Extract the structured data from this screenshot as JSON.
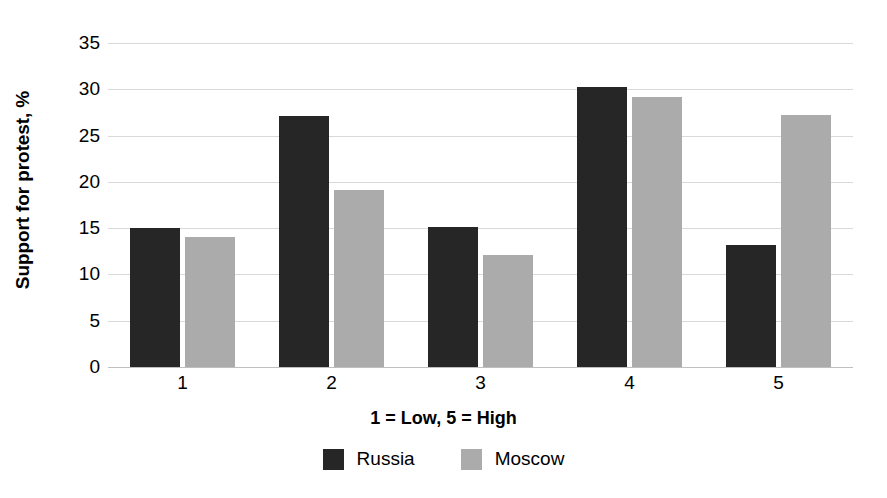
{
  "chart_data": {
    "type": "bar",
    "title": "",
    "subtitle": "",
    "xlabel": "1 = Low, 5 = High",
    "ylabel": "Support for protest, %",
    "categories": [
      "1",
      "2",
      "3",
      "4",
      "5"
    ],
    "series": [
      {
        "name": "Russia",
        "color": "#262626",
        "values": [
          15.0,
          27.1,
          15.1,
          30.2,
          13.2
        ]
      },
      {
        "name": "Moscow",
        "color": "#ababab",
        "values": [
          14.0,
          19.1,
          12.1,
          29.2,
          27.2
        ]
      }
    ],
    "ylim": [
      0,
      35
    ],
    "ytick_labels": [
      "0",
      "5",
      "10",
      "15",
      "20",
      "25",
      "30",
      "35"
    ],
    "ytick_values": [
      0,
      5,
      10,
      15,
      20,
      25,
      30,
      35
    ],
    "grid": true,
    "grid_color": "#d9d9d9",
    "legend_position": "bottom",
    "background": "#ffffff"
  }
}
